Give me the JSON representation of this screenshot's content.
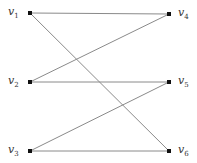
{
  "graph": {
    "type": "bipartite",
    "left_vertices": [
      {
        "id": "v1",
        "base": "v",
        "sub": "1"
      },
      {
        "id": "v2",
        "base": "v",
        "sub": "2"
      },
      {
        "id": "v3",
        "base": "v",
        "sub": "3"
      }
    ],
    "right_vertices": [
      {
        "id": "v4",
        "base": "v",
        "sub": "4"
      },
      {
        "id": "v5",
        "base": "v",
        "sub": "5"
      },
      {
        "id": "v6",
        "base": "v",
        "sub": "6"
      }
    ],
    "edges": [
      [
        "v1",
        "v4"
      ],
      [
        "v1",
        "v6"
      ],
      [
        "v2",
        "v4"
      ],
      [
        "v2",
        "v5"
      ],
      [
        "v3",
        "v5"
      ],
      [
        "v3",
        "v6"
      ]
    ]
  }
}
